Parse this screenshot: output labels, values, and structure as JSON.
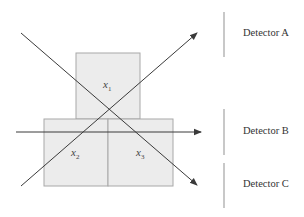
{
  "diagram": {
    "type": "tomography-detector-schematic",
    "cells": [
      {
        "id": "x1",
        "symbol": "x",
        "subscript": "1"
      },
      {
        "id": "x2",
        "symbol": "x",
        "subscript": "2"
      },
      {
        "id": "x3",
        "symbol": "x",
        "subscript": "3"
      }
    ],
    "detectors": [
      {
        "id": "A",
        "label": "Detector A"
      },
      {
        "id": "B",
        "label": "Detector B"
      },
      {
        "id": "C",
        "label": "Detector C"
      }
    ],
    "rays": [
      {
        "name": "ray-to-detector-a",
        "direction": "up-right"
      },
      {
        "name": "ray-to-detector-b",
        "direction": "horizontal"
      },
      {
        "name": "ray-to-detector-c",
        "direction": "down-right"
      }
    ],
    "colors": {
      "cell_fill": "#ececec",
      "cell_stroke": "#a8a8a8",
      "ray": "#3a3a3a",
      "detector_bar": "#c8c8c8"
    }
  }
}
